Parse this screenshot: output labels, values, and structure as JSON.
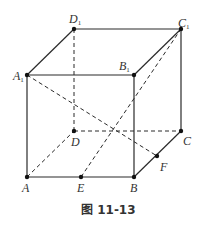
{
  "figure": {
    "caption": "图 11-13",
    "type": "cube-diagram"
  },
  "points": {
    "A": {
      "label": "A",
      "sub": "",
      "x": 27,
      "y": 177
    },
    "B": {
      "label": "B",
      "sub": "",
      "x": 134,
      "y": 177
    },
    "C": {
      "label": "C",
      "sub": "",
      "x": 181,
      "y": 131
    },
    "D": {
      "label": "D",
      "sub": "",
      "x": 74,
      "y": 131
    },
    "A1": {
      "label": "A",
      "sub": "1",
      "x": 27,
      "y": 75
    },
    "B1": {
      "label": "B",
      "sub": "1",
      "x": 134,
      "y": 75
    },
    "C1": {
      "label": "C",
      "sub": "1",
      "x": 181,
      "y": 29
    },
    "D1": {
      "label": "D",
      "sub": "1",
      "x": 74,
      "y": 29
    },
    "E": {
      "label": "E",
      "sub": "",
      "x": 81,
      "y": 177
    },
    "F": {
      "label": "F",
      "sub": "",
      "x": 157,
      "y": 156
    }
  },
  "solid_edges": [
    [
      "A",
      "B"
    ],
    [
      "B",
      "C"
    ],
    [
      "C",
      "C1"
    ],
    [
      "A",
      "A1"
    ],
    [
      "B",
      "B1"
    ],
    [
      "A1",
      "B1"
    ],
    [
      "B1",
      "C1"
    ],
    [
      "C1",
      "D1"
    ],
    [
      "D1",
      "A1"
    ]
  ],
  "dashed_edges": [
    [
      "A",
      "D"
    ],
    [
      "D",
      "C"
    ],
    [
      "D",
      "D1"
    ],
    [
      "A1",
      "F"
    ],
    [
      "E",
      "C1"
    ]
  ]
}
